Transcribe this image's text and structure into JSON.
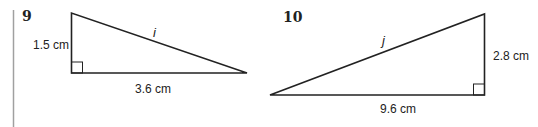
{
  "problems": [
    {
      "number": "9",
      "hypotenuse_label": "i",
      "vertical_side": "1.5 cm",
      "horizontal_side": "3.6 cm",
      "right_angle_position": "bottom-left"
    },
    {
      "number": "10",
      "hypotenuse_label": "j",
      "vertical_side": "2.8 cm",
      "horizontal_side": "9.6 cm",
      "right_angle_position": "bottom-right"
    }
  ],
  "colors": {
    "stroke": "#222222",
    "margin_bar": "#a0a0a0"
  }
}
